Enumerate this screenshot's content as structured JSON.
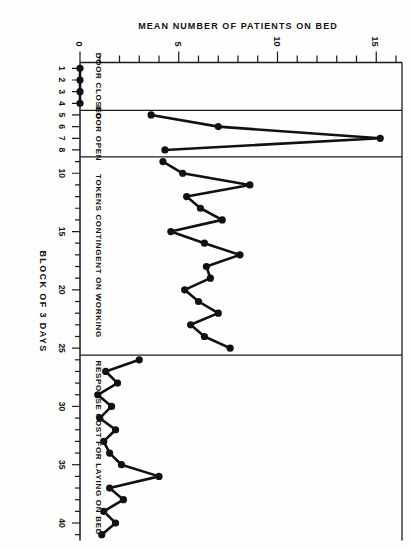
{
  "figure": {
    "orientation_note": "rotated-90",
    "ink_color": "#111111",
    "background_color": "#fefefe"
  },
  "chart_data": {
    "type": "line",
    "title": "",
    "xlabel": "BLOCK OF 3 DAYS",
    "ylabel": "MEAN NUMBER OF PATIENTS ON BED",
    "xlim": [
      0.5,
      41.5
    ],
    "ylim": [
      0,
      16
    ],
    "grid": false,
    "legend": "none",
    "y_ticks_major": [
      0,
      5,
      10,
      15
    ],
    "y_ticks_minor_step": 1,
    "x_ticks_labeled": [
      1,
      2,
      3,
      4,
      5,
      6,
      7,
      8,
      10,
      15,
      20,
      25,
      30,
      35,
      40
    ],
    "x_tick_labels": [
      "1",
      "2",
      "3",
      "4",
      "5",
      "6",
      "7",
      "8",
      "10",
      "15",
      "20",
      "25",
      "30",
      "35",
      "40"
    ],
    "phases": [
      {
        "name": "DOOR CLOSED",
        "label": "DOOR CLOSED",
        "x_start": 0.5,
        "x_end": 4.6,
        "x": [
          1,
          2,
          3,
          4
        ],
        "y": [
          0,
          0,
          0,
          0
        ]
      },
      {
        "name": "DOOR OPEN",
        "label": "DOOR OPEN",
        "x_start": 4.6,
        "x_end": 8.6,
        "x": [
          5,
          6,
          7,
          8
        ],
        "y": [
          3.6,
          7.0,
          15.2,
          4.3
        ]
      },
      {
        "name": "TOKENS CONTINGENT ON WORKING",
        "label": "TOKENS CONTINGENT ON WORKING",
        "x_start": 8.6,
        "x_end": 25.6,
        "x": [
          9,
          10,
          11,
          12,
          13,
          14,
          15,
          16,
          17,
          18,
          19,
          20,
          21,
          22,
          23,
          24,
          25
        ],
        "y": [
          4.2,
          5.2,
          8.6,
          5.4,
          6.1,
          7.2,
          4.6,
          6.3,
          8.1,
          6.4,
          6.6,
          5.3,
          6.0,
          7.0,
          5.6,
          6.3,
          7.6
        ]
      },
      {
        "name": "RESPONSE COST FOR LAYING ON BED",
        "label": "RESPONSE COST FOR LAYING ON BED",
        "x_start": 25.6,
        "x_end": 41.5,
        "x": [
          26,
          27,
          28,
          29,
          30,
          31,
          32,
          33,
          34,
          35,
          36,
          37,
          38,
          39,
          40,
          41
        ],
        "y": [
          3.0,
          1.3,
          1.9,
          0.9,
          1.6,
          1.0,
          1.8,
          1.2,
          1.5,
          2.1,
          4.0,
          1.5,
          2.2,
          1.2,
          1.8,
          1.1
        ]
      }
    ]
  },
  "axes": {
    "x_axis_title": "BLOCK OF 3 DAYS",
    "y_axis_title": "MEAN NUMBER OF PATIENTS ON BED",
    "y_labels": [
      "0",
      "5",
      "10",
      "15"
    ]
  }
}
